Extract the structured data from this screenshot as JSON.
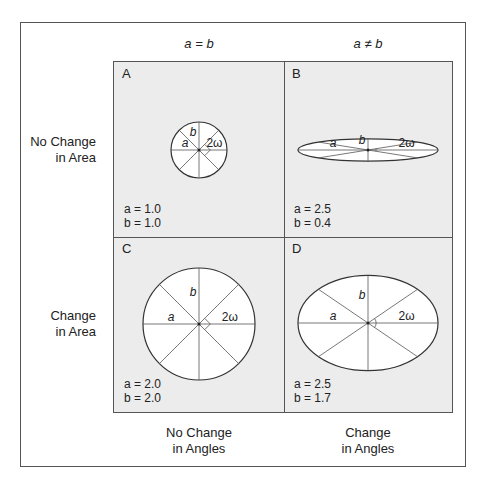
{
  "column_headers": [
    {
      "id": "equal",
      "text": "a = b"
    },
    {
      "id": "not-equal",
      "text": "a ≠ b"
    }
  ],
  "row_headers": [
    {
      "id": "no-change-area",
      "line1": "No Change",
      "line2": "in Area"
    },
    {
      "id": "change-area",
      "line1": "Change",
      "line2": "in Area"
    }
  ],
  "footers": [
    {
      "id": "no-change-angles",
      "line1": "No Change",
      "line2": "in Angles"
    },
    {
      "id": "change-angles",
      "line1": "Change",
      "line2": "in Angles"
    }
  ],
  "panels": [
    {
      "label": "A",
      "a_text": "a = 1.0",
      "b_text": "b = 1.0",
      "a": 1.0,
      "b": 1.0,
      "angle_marker": "right-angle"
    },
    {
      "label": "B",
      "a_text": "a = 2.5",
      "b_text": "b = 0.4",
      "a": 2.5,
      "b": 0.4,
      "angle_marker": "arc"
    },
    {
      "label": "C",
      "a_text": "a = 2.0",
      "b_text": "b = 2.0",
      "a": 2.0,
      "b": 2.0,
      "angle_marker": "right-angle"
    },
    {
      "label": "D",
      "a_text": "a = 2.5",
      "b_text": "b = 1.7",
      "a": 2.5,
      "b": 1.7,
      "angle_marker": "arc"
    }
  ],
  "axis_labels": {
    "a": "a",
    "b": "b",
    "omega": "2ω"
  },
  "colors": {
    "line": "#555555",
    "panel_bg": "#ececec",
    "ellipse_fill": "#ffffff",
    "outline": "#333333"
  }
}
